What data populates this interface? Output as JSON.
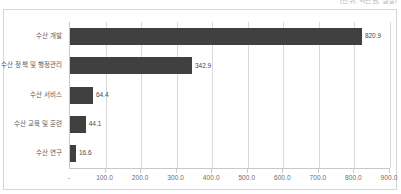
{
  "top_caption": {
    "text": "(단위: 백만원, 실질)"
  },
  "chart_data": {
    "type": "bar",
    "orientation": "horizontal",
    "title": "",
    "subtitle": "",
    "xlabel": "",
    "ylabel": "",
    "categories": [
      "수산 개발",
      "수산 정책 및 행정관리",
      "수산 서비스",
      "수산 교육 및 훈련",
      "수산 연구"
    ],
    "values": [
      820.9,
      342.9,
      64.4,
      44.1,
      16.6
    ],
    "value_labels": [
      "820.9",
      "342.9",
      "64.4",
      "44.1",
      "16.6"
    ],
    "xlim": [
      0,
      900
    ],
    "xticks": [
      0,
      100,
      200,
      300,
      400,
      500,
      600,
      700,
      800,
      900
    ],
    "xtick_labels": [
      "-",
      "100.0",
      "200.0",
      "300.0",
      "400.0",
      "500.0",
      "600.0",
      "700.0",
      "800.0",
      "900.0"
    ],
    "grid": "vertical",
    "legend": "none",
    "bar_color": "#404040",
    "gridline_color": "#d9d9d9",
    "axis_color": "#c8c8c8",
    "label_color": "#5a5a5a",
    "frame_color": "#d5d5d5"
  }
}
